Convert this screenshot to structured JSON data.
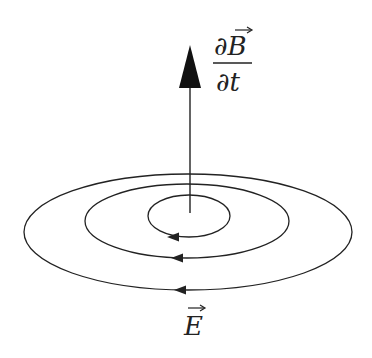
{
  "diagram": {
    "vector_label": {
      "numerator": "∂B",
      "denominator": "∂t",
      "vector_symbol": "B"
    },
    "field_label": {
      "text": "E"
    },
    "colors": {
      "stroke": "#222222",
      "background": "#ffffff"
    }
  }
}
